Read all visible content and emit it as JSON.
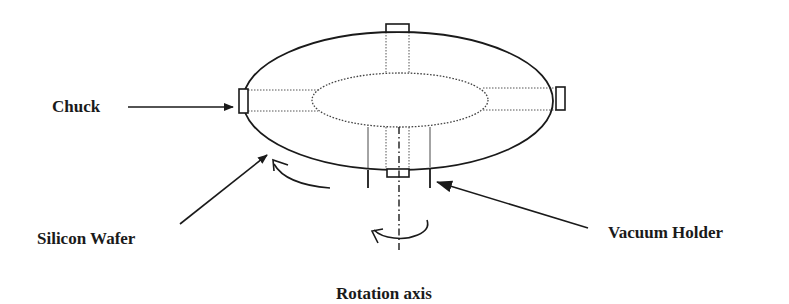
{
  "diagram": {
    "labels": {
      "chuck": "Chuck",
      "silicon_wafer": "Silicon Wafer",
      "vacuum_holder": "Vacuum Holder",
      "rotation_axis": "Rotation axis"
    },
    "components": [
      {
        "id": "wafer",
        "shape": "ellipse",
        "style": "solid",
        "cx": 398,
        "cy": 101,
        "rx": 155,
        "ry": 69
      },
      {
        "id": "inner-region",
        "shape": "ellipse",
        "style": "dotted",
        "cx": 400,
        "cy": 100,
        "rx": 88,
        "ry": 27
      },
      {
        "id": "chuck-pin-top",
        "shape": "rect",
        "x": 386,
        "y": 24,
        "w": 23,
        "h": 8
      },
      {
        "id": "chuck-pin-left",
        "shape": "rect",
        "x": 239,
        "y": 89,
        "w": 9,
        "h": 24
      },
      {
        "id": "chuck-pin-right",
        "shape": "rect",
        "x": 556,
        "y": 87,
        "w": 9,
        "h": 23
      },
      {
        "id": "chuck-pin-bottom",
        "shape": "rect",
        "x": 387,
        "y": 169,
        "w": 22,
        "h": 8
      },
      {
        "id": "vacuum-holder",
        "shape": "two-vertical-lines",
        "x1": 368,
        "x2": 430,
        "y_top": 127,
        "y_bottom": 188
      },
      {
        "id": "rotation-axis",
        "shape": "dash-dot-line",
        "x": 399,
        "y_top": 127,
        "y_bottom": 250
      }
    ],
    "colors": {
      "line": "#1a1a1a",
      "background": "#ffffff"
    }
  }
}
